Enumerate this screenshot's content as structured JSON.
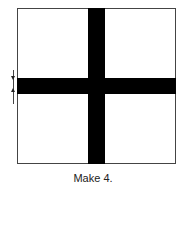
{
  "diagram": {
    "shape": "square block with cross strips",
    "caption": "Make 4.",
    "colors": {
      "strip": "#000000",
      "background": "#ffffff",
      "outline": "#444444"
    }
  }
}
